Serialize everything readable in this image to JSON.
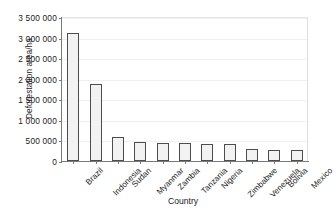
{
  "chart_data": {
    "type": "bar",
    "title": "",
    "xlabel": "Country",
    "ylabel": "Deforestation area/ha",
    "categories": [
      "Brazil",
      "Indonesia",
      "Sudan",
      "Myanmar",
      "Zambia",
      "Tanzania",
      "Nigeria",
      "Zimbabwe",
      "Venezuela",
      "Bolivia",
      "Mexico"
    ],
    "values": [
      3120000,
      1870000,
      590000,
      460000,
      450000,
      450000,
      420000,
      410000,
      290000,
      270000,
      260000
    ],
    "ylim": [
      0,
      3500000
    ],
    "ytick_values": [
      0,
      500000,
      1000000,
      1500000,
      2000000,
      2500000,
      3000000,
      3500000
    ],
    "ytick_labels": [
      "0",
      "500 000",
      "1 000 000",
      "1 500 000",
      "2 000 000",
      "2 500 000",
      "3 000 000",
      "3 500 000"
    ],
    "grid": true,
    "legend": false,
    "bar_fill_color": "#f2f2f2",
    "bar_edge_color": "#4d4d4d",
    "axis_color": "#7a7a7a",
    "gridline_color": "#f0f0f0",
    "background_color": "#ffffff"
  }
}
